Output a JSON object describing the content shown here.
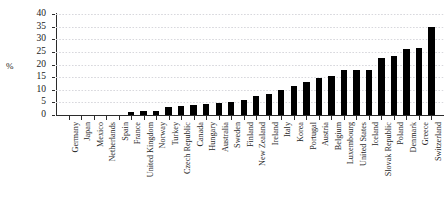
{
  "chart_data": {
    "type": "bar",
    "title": "",
    "subtitle": "",
    "xlabel": "",
    "ylabel": "%",
    "ylim": [
      0,
      40
    ],
    "yticks": [
      0,
      5,
      10,
      15,
      20,
      25,
      30,
      35,
      40
    ],
    "grid": true,
    "legend": false,
    "bar_color": "#000000",
    "grid_color": "#d8d8dd",
    "axis_color": "#2b2b2b",
    "categories": [
      "Germany",
      "Japan",
      "Mexico",
      "Netherlands",
      "Spain",
      "France",
      "United Kingdom",
      "Norway",
      "Turkey",
      "Czech Republic",
      "Canada",
      "Hungary",
      "Australia",
      "Sweden",
      "Finland",
      "New Zealand",
      "Ireland",
      "Italy",
      "Korea",
      "Portugal",
      "Austria",
      "Belgium",
      "Luxembourg",
      "United States",
      "Iceland",
      "Slovak Republic",
      "Poland",
      "Denmark",
      "Greece",
      "Switzerland"
    ],
    "values": [
      0.0,
      0.0,
      0.0,
      0.0,
      0.0,
      1.0,
      1.4,
      1.5,
      3.0,
      3.4,
      4.0,
      4.3,
      4.6,
      5.2,
      6.0,
      7.5,
      8.5,
      10.0,
      11.5,
      13.0,
      14.5,
      15.5,
      18.0,
      18.0,
      18.0,
      22.5,
      23.5,
      26.0,
      26.5,
      35.0
    ]
  }
}
